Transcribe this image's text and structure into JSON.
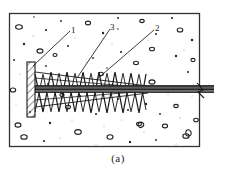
{
  "figure": {
    "caption": "(a)",
    "title": "",
    "kind": "engineering-cross-section",
    "colors": {
      "line": "#1a1a1a",
      "concrete_fill": "#ffffff",
      "aggregate": "#2b2b2b",
      "tendon": "#4a4a4a",
      "frame": "#333333"
    },
    "callouts": [
      {
        "id": "1",
        "label": "1",
        "target": "anchor-plate"
      },
      {
        "id": "3",
        "label": "3",
        "target": "spiral-reinforcement"
      },
      {
        "id": "2",
        "label": "2",
        "target": "tendon-bar"
      }
    ],
    "frame": {
      "x": 9,
      "y": 13,
      "w": 191,
      "h": 134
    },
    "anchor_plate": {
      "x": 27,
      "y": 62,
      "w": 8,
      "h": 55
    },
    "tendon": {
      "x1": 35,
      "y1": 89,
      "x2": 214,
      "y2": 89,
      "thickness": 7
    },
    "spiral": {
      "start_x": 35,
      "end_x": 146,
      "top_y": 72,
      "bottom_y": 112,
      "zigzag_count": 7
    }
  }
}
